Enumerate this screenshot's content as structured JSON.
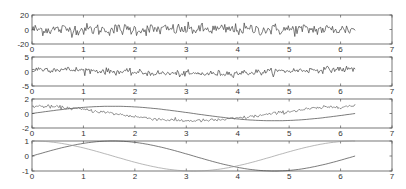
{
  "chart_data": [
    {
      "type": "line",
      "title": "",
      "xlabel": "",
      "ylabel": "",
      "xlim": [
        0,
        7
      ],
      "ylim": [
        -20,
        20
      ],
      "x_ticks": [
        "0",
        "1",
        "2",
        "3",
        "4",
        "5",
        "6",
        "7"
      ],
      "y_ticks": [
        "20",
        "0",
        "-20"
      ],
      "grid": false,
      "series": [
        {
          "name": "noise_large",
          "description": "high-amplitude random noise around 0, spanning ~ -15 to +15, x from 0 to 2π",
          "x_range": [
            0,
            6.283
          ],
          "mean": 0,
          "amplitude": 7,
          "color": "#444444"
        }
      ]
    },
    {
      "type": "line",
      "xlim": [
        0,
        7
      ],
      "ylim": [
        -5,
        5
      ],
      "x_ticks": [
        "0",
        "1",
        "2",
        "3",
        "4",
        "5",
        "6",
        "7"
      ],
      "y_ticks": [
        "5",
        "0",
        "-5"
      ],
      "grid": false,
      "series": [
        {
          "name": "noisy_signal",
          "description": "noise (~±1.5) superimposed on slow cosine trend ~ from +1 to -1 to +1",
          "x_range": [
            0,
            6.283
          ],
          "trend": "cos",
          "trend_amplitude": 1,
          "noise_amplitude": 0.9,
          "color": "#444444"
        }
      ]
    },
    {
      "type": "line",
      "xlim": [
        0,
        7
      ],
      "ylim": [
        -2,
        2
      ],
      "x_ticks": [
        "0",
        "1",
        "2",
        "3",
        "4",
        "5",
        "6",
        "7"
      ],
      "y_ticks": [
        "2",
        "0",
        "-2"
      ],
      "grid": false,
      "series": [
        {
          "name": "smooth_sin",
          "description": "smooth sine, 0 at x=0, peak 1 near π/2, min -1 near 3π/2",
          "x_range": [
            0,
            6.283
          ],
          "func": "sin",
          "amplitude": 1,
          "noise": 0,
          "color": "#444444"
        },
        {
          "name": "noisy_cos",
          "description": "cosine with small noise, 1 at x=0, -1 near π",
          "x_range": [
            0,
            6.283
          ],
          "func": "cos",
          "amplitude": 1,
          "noise": 0.12,
          "color": "#666666"
        }
      ]
    },
    {
      "type": "line",
      "xlim": [
        0,
        7
      ],
      "ylim": [
        -1,
        1
      ],
      "x_ticks": [
        "0",
        "1",
        "2",
        "3",
        "4",
        "5",
        "6",
        "7"
      ],
      "y_ticks": [
        "1",
        "0",
        "-1"
      ],
      "grid": false,
      "series": [
        {
          "name": "sin",
          "x_range": [
            0,
            6.283
          ],
          "func": "sin",
          "amplitude": 1,
          "color": "#444444"
        },
        {
          "name": "cos",
          "x_range": [
            0,
            6.283
          ],
          "func": "cos",
          "amplitude": 1,
          "color": "#999999"
        }
      ]
    }
  ],
  "layout": {
    "x_left_px": 32,
    "x_right_px": 392,
    "panels_px": [
      {
        "top": 15,
        "bottom": 44
      },
      {
        "top": 57,
        "bottom": 86
      },
      {
        "top": 99,
        "bottom": 128
      },
      {
        "top": 141,
        "bottom": 171
      }
    ]
  }
}
